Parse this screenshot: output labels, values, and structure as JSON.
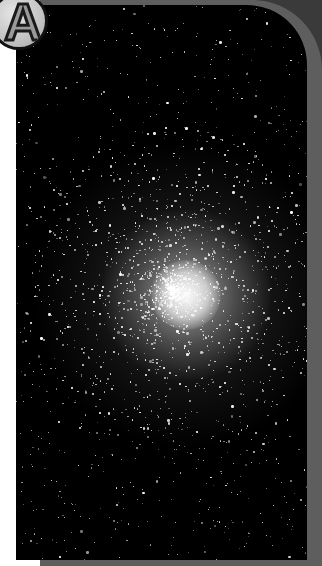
{
  "figure": {
    "panel_label": "A",
    "colors": {
      "frame_dark": "#3a3a3a",
      "frame_band": "#5e5e5e",
      "sky": "#000000",
      "badge_fill": "#c8c8c8",
      "badge_outline": "#111111"
    }
  }
}
